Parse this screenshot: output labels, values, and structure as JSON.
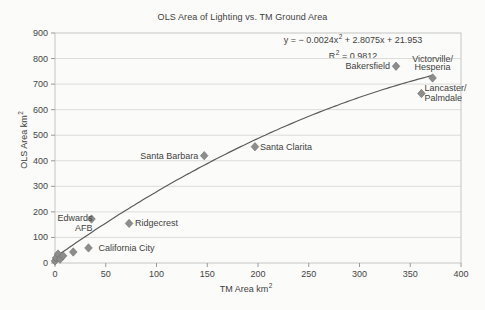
{
  "chart_data": {
    "type": "scatter",
    "title": "OLS Area of Lighting vs. TM Ground Area",
    "xlabel": "TM Area km",
    "xlabel_sup": "2",
    "ylabel": "OLS Area km",
    "ylabel_sup": "2",
    "xlim": [
      0,
      400
    ],
    "ylim": [
      0,
      900
    ],
    "xticks": [
      0,
      50,
      100,
      150,
      200,
      250,
      300,
      350,
      400
    ],
    "yticks": [
      0,
      100,
      200,
      300,
      400,
      500,
      600,
      700,
      800,
      900
    ],
    "grid": "horizontal-only",
    "legend": "none",
    "trendline": {
      "type": "quadratic",
      "coefficients": {
        "a": -0.0024,
        "b": 2.8075,
        "c": 21.953
      },
      "r_squared": 0.9812,
      "x_range": [
        0,
        372
      ],
      "eq_pre": "y = − 0.0024x",
      "eq_sup": "2",
      "eq_post": " + 2.8075x + 21.953",
      "r2_pre": "R",
      "r2_sup": "2",
      "r2_post": " = 0.9812"
    },
    "points": [
      {
        "x": 0,
        "y": 8
      },
      {
        "x": 1,
        "y": 20
      },
      {
        "x": 3,
        "y": 35
      },
      {
        "x": 5,
        "y": 15
      },
      {
        "x": 8,
        "y": 28
      },
      {
        "x": 18,
        "y": 43
      },
      {
        "x": 33,
        "y": 59,
        "label": "California City",
        "label_side": "right",
        "label_dx": 10
      },
      {
        "x": 36,
        "y": 172,
        "label": "Edwards\nAFB",
        "label_side": "left",
        "label_dx": 1
      },
      {
        "x": 73,
        "y": 155,
        "label": "Ridgecrest",
        "label_side": "right",
        "label_dx": 6
      },
      {
        "x": 147,
        "y": 420,
        "label": "Santa Barbara",
        "label_side": "left",
        "label_dx": -6
      },
      {
        "x": 197,
        "y": 455,
        "label": "Santa Clarita",
        "label_side": "right",
        "label_dx": 5
      },
      {
        "x": 336,
        "y": 770,
        "label": "Bakersfield",
        "label_side": "left",
        "label_dx": -6
      },
      {
        "x": 372,
        "y": 724,
        "label": "Victorville/\nHesperia",
        "label_side": "above",
        "label_dx": 0
      },
      {
        "x": 361,
        "y": 663,
        "label": "Lancaster/\nPalmdale",
        "label_side": "right",
        "label_dx": 3
      }
    ],
    "colors": {
      "marker": "#8d8d8d",
      "marker_edge": "#6f6f6f",
      "trendline": "#5c5c5c",
      "grid": "#dcdcda",
      "axis": "#9a9a98",
      "frame": "#c6c6c4",
      "text": "#3f3f3f",
      "background": "#fbfbf9"
    }
  }
}
